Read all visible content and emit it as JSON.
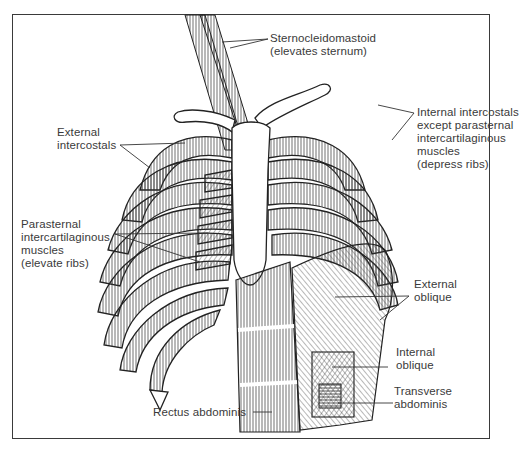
{
  "figure": {
    "labels": [
      {
        "id": "sternocleidomastoid",
        "lines": [
          "Sternocleidomastoid",
          "(elevates sternum)"
        ]
      },
      {
        "id": "external-intercostals",
        "lines": [
          "External",
          "intercostals"
        ]
      },
      {
        "id": "internal-intercostals",
        "lines": [
          "Internal intercostals",
          "except parasternal",
          "intercartilaginous",
          "muscles",
          "(depress ribs)"
        ]
      },
      {
        "id": "parasternal-intercartilaginous",
        "lines": [
          "Parasternal",
          "intercartilaginous",
          "muscles",
          "(elevate ribs)"
        ]
      },
      {
        "id": "external-oblique",
        "lines": [
          "External",
          "oblique"
        ]
      },
      {
        "id": "internal-oblique",
        "lines": [
          "Internal",
          "oblique"
        ]
      },
      {
        "id": "transverse-abdominis",
        "lines": [
          "Transverse",
          "abdominis"
        ]
      },
      {
        "id": "rectus-abdominis",
        "lines": [
          "Rectus abdominis"
        ]
      }
    ]
  },
  "colors": {
    "ink": "#2a2a2a",
    "background": "#ffffff",
    "frame": "#3a3a3a"
  }
}
